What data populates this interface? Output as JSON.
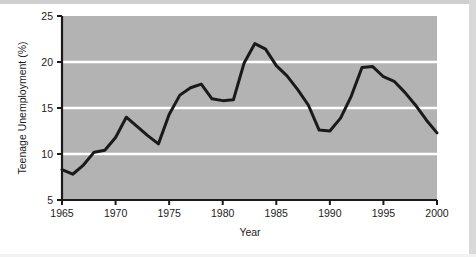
{
  "chart_data": {
    "type": "line",
    "title": "",
    "xlabel": "Year",
    "ylabel": "Teenage Unemployment (%)",
    "xlim": [
      1965,
      2000
    ],
    "ylim": [
      5,
      25
    ],
    "xticks": [
      1965,
      1970,
      1975,
      1980,
      1985,
      1990,
      1995,
      2000
    ],
    "yticks": [
      5,
      10,
      15,
      20,
      25
    ],
    "xtick_labels": [
      "1965",
      "1970",
      "1975",
      "1980",
      "1985",
      "1990",
      "1995",
      "2000"
    ],
    "ytick_labels": [
      "5",
      "10",
      "15",
      "20",
      "25"
    ],
    "grid": "horizontal-white-gridlines-at-10-15-20",
    "legend": "none",
    "plot_background_color": "#b3b3b3",
    "gridline_color": "#ffffff",
    "line_color": "#1a1a1a",
    "line_width_px": 3,
    "axis_color": "#1a1a1a",
    "x": [
      1965,
      1966,
      1967,
      1968,
      1969,
      1970,
      1971,
      1972,
      1973,
      1974,
      1975,
      1976,
      1977,
      1978,
      1979,
      1980,
      1981,
      1982,
      1983,
      1984,
      1985,
      1986,
      1987,
      1988,
      1989,
      1990,
      1991,
      1992,
      1993,
      1994,
      1995,
      1996,
      1997,
      1998,
      1999,
      2000
    ],
    "values": [
      8.3,
      7.8,
      8.8,
      10.2,
      10.4,
      11.8,
      14.0,
      13.0,
      12.0,
      11.1,
      14.3,
      16.4,
      17.2,
      17.6,
      16.0,
      15.8,
      15.9,
      19.9,
      22.0,
      21.4,
      19.6,
      18.5,
      17.0,
      15.3,
      12.6,
      12.5,
      13.9,
      16.3,
      19.4,
      19.5,
      18.4,
      17.9,
      16.7,
      15.3,
      13.7,
      12.3
    ],
    "series_name": "Teenage Unemployment"
  },
  "axes": {
    "y_title": "Teenage Unemployment (%)",
    "x_title": "Year",
    "y_ticks": [
      "25",
      "20",
      "15",
      "10",
      "5"
    ],
    "x_ticks": [
      "1965",
      "1970",
      "1975",
      "1980",
      "1985",
      "1990",
      "1995",
      "2000"
    ]
  }
}
